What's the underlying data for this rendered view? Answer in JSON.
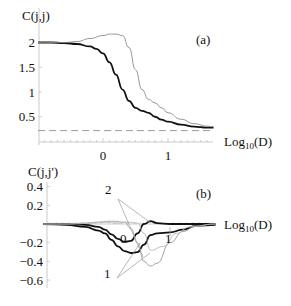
{
  "chart_data": [
    {
      "panel": "(a)",
      "type": "line",
      "ylabel": "C(j,j)",
      "xlabel": "Log10(D)",
      "xlabel_base": "Log",
      "xlabel_sub": "10",
      "xlabel_arg": "(D)",
      "xlim": [
        -1.0,
        1.7
      ],
      "ylim": [
        0.0,
        2.2
      ],
      "xticks": [
        0,
        1
      ],
      "xtick_labels": [
        "0",
        "1"
      ],
      "yticks": [
        0.5,
        1,
        1.5,
        2
      ],
      "ytick_labels": [
        "0.5",
        "1",
        "1.5",
        "2"
      ],
      "grid": false,
      "legend": null,
      "series": [
        {
          "name": "thick",
          "style": "solid-thick",
          "color": "#111111",
          "x": [
            -1.0,
            -0.8,
            -0.6,
            -0.4,
            -0.2,
            -0.1,
            0.0,
            0.1,
            0.2,
            0.3,
            0.4,
            0.5,
            0.6,
            0.7,
            0.8,
            0.9,
            1.0,
            1.2,
            1.4,
            1.6,
            1.7
          ],
          "y": [
            2.0,
            2.0,
            1.99,
            1.97,
            1.92,
            1.87,
            1.78,
            1.6,
            1.35,
            1.05,
            0.82,
            0.68,
            0.62,
            0.58,
            0.5,
            0.44,
            0.4,
            0.34,
            0.3,
            0.28,
            0.28
          ]
        },
        {
          "name": "thin",
          "style": "solid-thin",
          "color": "#8a8a8a",
          "x": [
            -1.0,
            -0.8,
            -0.6,
            -0.4,
            -0.2,
            0.0,
            0.1,
            0.2,
            0.3,
            0.4,
            0.5,
            0.6,
            0.7,
            0.8,
            0.9,
            1.0,
            1.2,
            1.4,
            1.6,
            1.7
          ],
          "y": [
            2.0,
            2.0,
            2.0,
            2.02,
            2.08,
            2.14,
            2.17,
            2.17,
            2.14,
            1.9,
            1.45,
            1.05,
            0.85,
            0.78,
            0.68,
            0.58,
            0.45,
            0.36,
            0.31,
            0.3
          ]
        },
        {
          "name": "dashed-reference",
          "style": "dashed",
          "color": "#9a9a9a",
          "x": [
            -1.0,
            1.7
          ],
          "y": [
            0.22,
            0.22
          ]
        }
      ]
    },
    {
      "panel": "(b)",
      "type": "line",
      "ylabel": "C(j,j')",
      "xlabel": "Log10(D)",
      "xlabel_base": "Log",
      "xlabel_sub": "10",
      "xlabel_arg": "(D)",
      "xlim": [
        -0.95,
        1.7
      ],
      "ylim": [
        -0.65,
        0.4
      ],
      "xticks": [
        1
      ],
      "xtick_labels": [
        ""
      ],
      "yticks": [
        0.4,
        0.2,
        -0.2,
        -0.4,
        -0.6
      ],
      "ytick_labels": [
        "0.4",
        "0.2",
        "−0.2",
        "−0.4",
        "−0.6"
      ],
      "grid": false,
      "legend": null,
      "annotations": [
        {
          "text": "2",
          "x": 0.47,
          "y": 0.33
        },
        {
          "text": "0",
          "x": 0.2,
          "y": -0.13
        },
        {
          "text": "1",
          "x": 0.47,
          "y": -0.52
        },
        {
          "text": "1",
          "x": 1.0,
          "y": -0.07
        }
      ],
      "series": [
        {
          "name": "0",
          "style": "solid-thick",
          "color": "#111111",
          "x": [
            -0.95,
            -0.6,
            -0.3,
            -0.1,
            0.0,
            0.1,
            0.2,
            0.3,
            0.4,
            0.5,
            0.6,
            0.7,
            0.8,
            1.0,
            1.2,
            1.4,
            1.7
          ],
          "y": [
            0.0,
            0.0,
            -0.01,
            -0.03,
            -0.06,
            -0.11,
            -0.16,
            -0.19,
            -0.18,
            -0.1,
            0.0,
            0.03,
            0.01,
            0.0,
            0.0,
            0.0,
            0.0
          ]
        },
        {
          "name": "1",
          "style": "solid-thick",
          "color": "#111111",
          "x": [
            -0.95,
            -0.6,
            -0.3,
            -0.1,
            0.0,
            0.1,
            0.2,
            0.3,
            0.4,
            0.5,
            0.6,
            0.7,
            0.8,
            1.0,
            1.2,
            1.4,
            1.7
          ],
          "y": [
            0.0,
            -0.01,
            -0.03,
            -0.07,
            -0.1,
            -0.17,
            -0.24,
            -0.29,
            -0.31,
            -0.3,
            -0.22,
            -0.12,
            -0.1,
            -0.09,
            -0.06,
            -0.02,
            -0.01
          ]
        },
        {
          "name": "2",
          "style": "solid-thin",
          "color": "#9a9a9a",
          "x": [
            -0.95,
            -0.6,
            -0.3,
            -0.1,
            0.1,
            0.3,
            0.4,
            0.5,
            0.6,
            0.7,
            0.8,
            1.0,
            1.2,
            1.4,
            1.7
          ],
          "y": [
            0.0,
            0.0,
            0.01,
            0.02,
            0.03,
            0.02,
            -0.05,
            -0.2,
            -0.4,
            -0.45,
            -0.42,
            -0.2,
            -0.08,
            -0.02,
            0.0
          ]
        },
        {
          "name": "2b",
          "style": "solid-thin",
          "color": "#b5b5b5",
          "x": [
            -0.95,
            -0.5,
            -0.2,
            0.0,
            0.2,
            0.35,
            0.5,
            0.6,
            0.7,
            0.9,
            1.1,
            1.3,
            1.7
          ],
          "y": [
            0.0,
            0.0,
            0.01,
            0.02,
            0.01,
            0.02,
            0.01,
            -0.1,
            -0.28,
            -0.24,
            -0.1,
            -0.03,
            0.0
          ]
        }
      ]
    }
  ]
}
